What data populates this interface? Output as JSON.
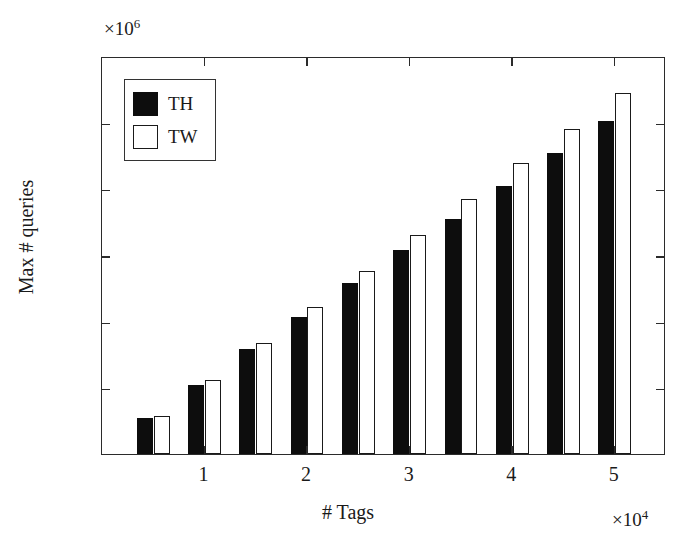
{
  "chart_data": {
    "type": "bar",
    "title": "",
    "xlabel": "# Tags",
    "ylabel": "Max # queries",
    "x_exponent_text": "×10",
    "x_exponent_power": "4",
    "y_exponent_text": "×10",
    "y_exponent_power": "6",
    "x_unit_scale": 10000,
    "y_unit_scale": 1000000,
    "xlim": [
      0,
      5.5
    ],
    "ylim": [
      0,
      3
    ],
    "grid": false,
    "legend_position": "upper left",
    "x_tick_labels": [
      "1",
      "2",
      "3",
      "4",
      "5"
    ],
    "x_tick_values": [
      1,
      2,
      3,
      4,
      5
    ],
    "y_tick_labels": [
      "0",
      "0.5",
      "1",
      "1.5",
      "2",
      "2.5",
      "3"
    ],
    "y_tick_values": [
      0,
      0.5,
      1,
      1.5,
      2,
      2.5,
      3
    ],
    "categories": [
      0.5,
      1.0,
      1.5,
      2.0,
      2.5,
      3.0,
      3.5,
      4.0,
      4.5,
      5.0
    ],
    "series": [
      {
        "name": "TH",
        "style": "filled",
        "color": "#0d0d0d",
        "values": [
          0.27,
          0.52,
          0.79,
          1.03,
          1.29,
          1.54,
          1.77,
          2.02,
          2.27,
          2.51
        ]
      },
      {
        "name": "TW",
        "style": "hollow",
        "color": "#ffffff",
        "edge_color": "#1a1a1a",
        "values": [
          0.29,
          0.56,
          0.84,
          1.11,
          1.38,
          1.65,
          1.92,
          2.19,
          2.45,
          2.72
        ]
      }
    ]
  },
  "legend": {
    "entries": [
      {
        "label": "TH",
        "style": "filled"
      },
      {
        "label": "TW",
        "style": "hollow"
      }
    ]
  }
}
